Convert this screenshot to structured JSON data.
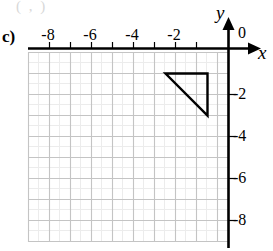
{
  "figure": {
    "part_label": "c)",
    "ghost_text": "(   ,   )",
    "axis_x_name": "x",
    "axis_y_name": "y",
    "origin_label": "0"
  },
  "chart_data": {
    "type": "scatter",
    "title": "",
    "xlabel": "x",
    "ylabel": "y",
    "xlim": [
      -9,
      0
    ],
    "ylim": [
      -9,
      0
    ],
    "grid": true,
    "major_step": 1,
    "minor_step": 0.5,
    "x_tick_labels": [
      "-8",
      "-6",
      "-4",
      "-2"
    ],
    "x_tick_values": [
      -8,
      -6,
      -4,
      -2
    ],
    "y_tick_labels": [
      "-2",
      "-4",
      "-6",
      "-8"
    ],
    "y_tick_values": [
      -2,
      -4,
      -6,
      -8
    ],
    "origin_label": "0",
    "shapes": [
      {
        "name": "right-triangle",
        "type": "polygon",
        "vertices": [
          [
            -3,
            -1
          ],
          [
            -1,
            -1
          ],
          [
            -1,
            -3
          ]
        ],
        "stroke": "#000000",
        "fill": "none",
        "stroke_width": 2.4
      }
    ],
    "colors": {
      "axis": "#000000",
      "grid_major": "#c9c9c9",
      "grid_minor": "#ececec",
      "shape": "#000000"
    }
  }
}
